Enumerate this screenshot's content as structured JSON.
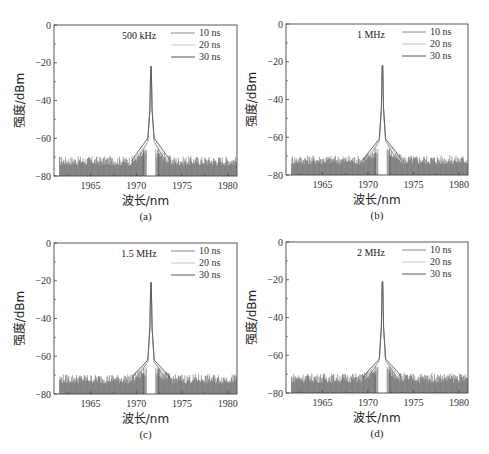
{
  "figure": {
    "panels": [
      {
        "id": "a",
        "caption": "(a)",
        "annotation": "500 kHz"
      },
      {
        "id": "b",
        "caption": "(b)",
        "annotation": "1 MHz"
      },
      {
        "id": "c",
        "caption": "(c)",
        "annotation": "1.5 MHz"
      },
      {
        "id": "d",
        "caption": "(d)",
        "annotation": "2 MHz"
      }
    ],
    "xlabel": "波长/nm",
    "ylabel": "强度/dBm",
    "legend": [
      "10 ns",
      "20 ns",
      "30 ns"
    ],
    "colors": {
      "10 ns": "#8a8a8a",
      "20 ns": "#c4c4c4",
      "30 ns": "#555555",
      "axis": "#444444",
      "noise": "#4a4a4a"
    }
  },
  "chart_data": [
    {
      "type": "line",
      "title": "500 kHz",
      "caption": "(a)",
      "xlabel": "波长/nm",
      "ylabel": "强度/dBm",
      "xlim": [
        1961,
        1981
      ],
      "ylim": [
        -80,
        0
      ],
      "xticks": [
        1965,
        1970,
        1975,
        1980
      ],
      "yticks": [
        0,
        -20,
        -40,
        -60,
        -80
      ],
      "legend_position": "upper right",
      "grid": false,
      "series": [
        {
          "name": "10 ns",
          "peak_wavelength_nm": 1971.6,
          "peak_dBm": -22,
          "pedestal_dBm": -62,
          "noise_floor_dBm": [
            -80,
            -70
          ]
        },
        {
          "name": "20 ns",
          "peak_wavelength_nm": 1971.6,
          "peak_dBm": -22,
          "pedestal_dBm": -62,
          "noise_floor_dBm": [
            -80,
            -70
          ]
        },
        {
          "name": "30 ns",
          "peak_wavelength_nm": 1971.6,
          "peak_dBm": -22,
          "pedestal_dBm": -60,
          "noise_floor_dBm": [
            -80,
            -70
          ]
        }
      ]
    },
    {
      "type": "line",
      "title": "1 MHz",
      "caption": "(b)",
      "xlabel": "波长/nm",
      "ylabel": "强度/dBm",
      "xlim": [
        1961,
        1981
      ],
      "ylim": [
        -80,
        0
      ],
      "xticks": [
        1965,
        1970,
        1975,
        1980
      ],
      "yticks": [
        0,
        -20,
        -40,
        -60,
        -80
      ],
      "legend_position": "upper right",
      "grid": false,
      "series": [
        {
          "name": "10 ns",
          "peak_wavelength_nm": 1971.6,
          "peak_dBm": -22,
          "pedestal_dBm": -62,
          "noise_floor_dBm": [
            -80,
            -70
          ]
        },
        {
          "name": "20 ns",
          "peak_wavelength_nm": 1971.6,
          "peak_dBm": -22,
          "pedestal_dBm": -62,
          "noise_floor_dBm": [
            -80,
            -70
          ]
        },
        {
          "name": "30 ns",
          "peak_wavelength_nm": 1971.6,
          "peak_dBm": -22,
          "pedestal_dBm": -61,
          "noise_floor_dBm": [
            -80,
            -70
          ]
        }
      ]
    },
    {
      "type": "line",
      "title": "1.5 MHz",
      "caption": "(c)",
      "xlabel": "波长/nm",
      "ylabel": "强度/dBm",
      "xlim": [
        1961,
        1981
      ],
      "ylim": [
        -80,
        0
      ],
      "xticks": [
        1965,
        1970,
        1975,
        1980
      ],
      "yticks": [
        0,
        -20,
        -40,
        -60,
        -80
      ],
      "legend_position": "upper right",
      "grid": false,
      "series": [
        {
          "name": "10 ns",
          "peak_wavelength_nm": 1971.6,
          "peak_dBm": -21,
          "pedestal_dBm": -63,
          "noise_floor_dBm": [
            -80,
            -70
          ]
        },
        {
          "name": "20 ns",
          "peak_wavelength_nm": 1971.6,
          "peak_dBm": -21,
          "pedestal_dBm": -63,
          "noise_floor_dBm": [
            -80,
            -70
          ]
        },
        {
          "name": "30 ns",
          "peak_wavelength_nm": 1971.6,
          "peak_dBm": -21,
          "pedestal_dBm": -62,
          "noise_floor_dBm": [
            -80,
            -70
          ]
        }
      ]
    },
    {
      "type": "line",
      "title": "2 MHz",
      "caption": "(d)",
      "xlabel": "波长/nm",
      "ylabel": "强度/dBm",
      "xlim": [
        1961,
        1981
      ],
      "ylim": [
        -80,
        0
      ],
      "xticks": [
        1965,
        1970,
        1975,
        1980
      ],
      "yticks": [
        0,
        -20,
        -40,
        -60,
        -80
      ],
      "legend_position": "upper right",
      "grid": false,
      "series": [
        {
          "name": "10 ns",
          "peak_wavelength_nm": 1971.6,
          "peak_dBm": -21,
          "pedestal_dBm": -63,
          "noise_floor_dBm": [
            -80,
            -70
          ]
        },
        {
          "name": "20 ns",
          "peak_wavelength_nm": 1971.6,
          "peak_dBm": -21,
          "pedestal_dBm": -63,
          "noise_floor_dBm": [
            -80,
            -70
          ]
        },
        {
          "name": "30 ns",
          "peak_wavelength_nm": 1971.6,
          "peak_dBm": -21,
          "pedestal_dBm": -62,
          "noise_floor_dBm": [
            -80,
            -70
          ]
        }
      ]
    }
  ]
}
